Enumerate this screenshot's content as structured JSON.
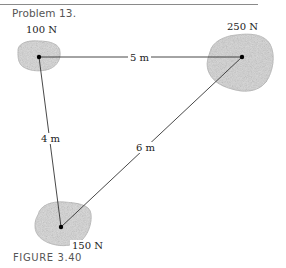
{
  "header": {
    "problem_label": "Problem 13."
  },
  "figure": {
    "caption": "FIGURE 3.40",
    "masses": [
      {
        "weight_label": "100 N",
        "x": 39,
        "y": 57
      },
      {
        "weight_label": "250 N",
        "x": 242,
        "y": 57
      },
      {
        "weight_label": "150 N",
        "x": 61,
        "y": 227
      }
    ],
    "distances": [
      {
        "label": "5 m",
        "between": "100 N - 250 N"
      },
      {
        "label": "4 m",
        "between": "100 N - 150 N"
      },
      {
        "label": "6 m",
        "between": "150 N - 250 N"
      }
    ],
    "colors": {
      "rock_fill": "#cfcfcf",
      "rock_edge": "#a8a8a8",
      "line": "#333333",
      "dot": "#000000"
    }
  }
}
